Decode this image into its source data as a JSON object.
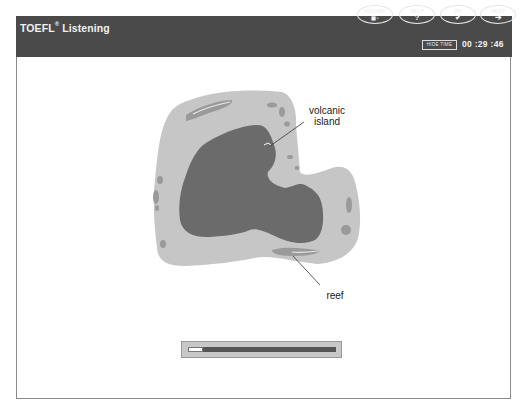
{
  "header": {
    "title": "TOEFL",
    "title_reg": "®",
    "title_suffix": " Listening",
    "buttons": [
      {
        "label": "VOLUME",
        "icon": "volume-icon",
        "glyph": "◼▫"
      },
      {
        "label": "HELP",
        "icon": "help-icon",
        "glyph": "?"
      },
      {
        "label": "OK",
        "icon": "check-icon",
        "glyph": "✔"
      },
      {
        "label": "NEXT",
        "icon": "arrow-right-icon",
        "glyph": "➔"
      }
    ],
    "hide_time_label": "HIDE TIME",
    "timer": "00 :29 :46"
  },
  "diagram": {
    "labels": {
      "volcanic_line1": "volcanic",
      "volcanic_line2": "island",
      "reef": "reef"
    },
    "colors": {
      "lagoon": "#c6c6c6",
      "island": "#6b6b6b",
      "reef_patch": "#9a9a9a"
    }
  },
  "audio_progress": {
    "percent": 10
  }
}
